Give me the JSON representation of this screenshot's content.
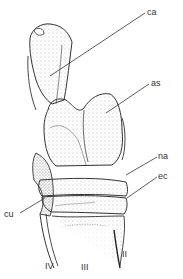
{
  "figure": {
    "labels": {
      "ca": "ca",
      "as": "as",
      "na": "na",
      "ec": "ec",
      "cu": "cu",
      "mt4": "IV",
      "mt3": "III",
      "mt2": "II"
    },
    "colors": {
      "ink": "#333333",
      "stipple": "#666666",
      "background": "#ffffff"
    }
  }
}
